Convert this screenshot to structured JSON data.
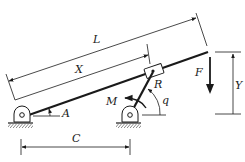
{
  "diagram": {
    "type": "mechanism",
    "labels": {
      "L": "L",
      "X": "X",
      "A": "A",
      "R": "R",
      "M": "M",
      "q": "q",
      "F": "F",
      "Y": "Y",
      "C": "C"
    },
    "colors": {
      "ink": "#1a1a1a",
      "background": "#ffffff"
    }
  }
}
